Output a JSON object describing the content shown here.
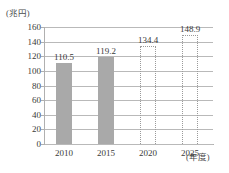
{
  "chart_data": {
    "type": "bar",
    "title": "",
    "subtitle": "",
    "xlabel": "(年度)",
    "ylabel": "(兆円)",
    "categories": [
      "2010",
      "2015",
      "2020",
      "2025"
    ],
    "values": [
      110.5,
      119.2,
      134.4,
      148.9
    ],
    "value_labels": [
      "110.5",
      "119.2",
      "134.4",
      "148.9"
    ],
    "series": [
      {
        "name": "",
        "values": [
          110.5,
          119.2,
          134.4,
          148.9
        ],
        "styles": [
          "actual",
          "actual",
          "projected",
          "projected"
        ]
      }
    ],
    "ylim": [
      0,
      160
    ],
    "ytick_values": [
      0,
      20,
      40,
      60,
      80,
      100,
      120,
      140,
      160
    ],
    "ytick_labels": [
      "0",
      "20",
      "40",
      "60",
      "80",
      "100",
      "120",
      "140",
      "160"
    ],
    "grid": true,
    "grid_axis": "y",
    "legend": false,
    "legend_position": "none",
    "colors": {
      "bar_actual": "#a9a9a9",
      "bar_projected_border": "#9a9a9a",
      "gridline": "#b9b9b9",
      "axis": "#b0b0b0",
      "text": "#3a3a3a",
      "background": "#ffffff"
    }
  }
}
